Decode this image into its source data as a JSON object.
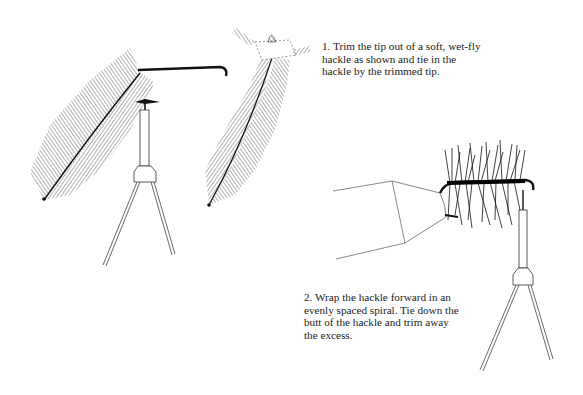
{
  "page": {
    "background": "#ffffff",
    "ink_color": "#1a1a1a"
  },
  "steps": [
    {
      "number": "1.",
      "lines": [
        "1.  Trim the tip out of a soft, wet-fly",
        "hackle as shown and tie in the",
        "hackle by the trimmed tip."
      ]
    },
    {
      "number": "2.",
      "lines": [
        "2.  Wrap the hackle forward in an",
        "evenly spaced spiral. Tie down the",
        "butt of the hackle and trim away",
        "the excess."
      ]
    }
  ],
  "figures": [
    {
      "id": "fig-1a",
      "depicts": "hackle feather tied to hook in vise"
    },
    {
      "id": "fig-1b",
      "depicts": "hackle feather with trimmed tip"
    },
    {
      "id": "fig-2",
      "depicts": "hackle wrapped along hook shank in vise with hand/hackle pliers"
    }
  ]
}
